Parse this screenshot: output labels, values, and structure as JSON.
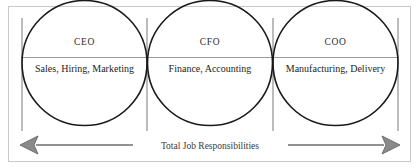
{
  "diagram": {
    "title": "Total Job Responsibilities",
    "frame": {
      "border_color": "#c9c9c9",
      "background": "#ffffff"
    },
    "style": {
      "circle_stroke": "#1a1a1a",
      "divider_color": "#8f8f8f",
      "baseline_color": "#9a9a9a",
      "arrow_color": "#6e6e6e",
      "text_color": "#1c1c1c",
      "role_text_color": "#2b2b2b"
    },
    "segments": [
      {
        "role": "CEO",
        "duties": "Sales, Hiring, Marketing"
      },
      {
        "role": "CFO",
        "duties": "Finance, Accounting"
      },
      {
        "role": "COO",
        "duties": "Manufacturing, Delivery"
      }
    ],
    "axis": {
      "label": "Total Job Responsibilities",
      "left_arrowhead": "left-arrow-icon",
      "right_arrowhead": "right-arrow-icon"
    }
  }
}
